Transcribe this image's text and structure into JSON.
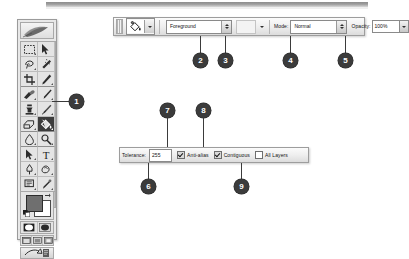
{
  "figure": {
    "application": "Adobe Photoshop",
    "context": "Paint Bucket tool options bar"
  },
  "toolbox": {
    "name": "Toolbox palette",
    "selected_tool": "paint-bucket-tool",
    "tools": [
      {
        "row": 0,
        "left": "rectangular-marquee-tool",
        "right": "move-tool"
      },
      {
        "row": 1,
        "left": "lasso-tool",
        "right": "magic-wand-tool"
      },
      {
        "row": 2,
        "left": "crop-tool",
        "right": "slice-tool"
      },
      {
        "row": 3,
        "left": "healing-brush-tool",
        "right": "brush-tool"
      },
      {
        "row": 4,
        "left": "clone-stamp-tool",
        "right": "history-brush-tool"
      },
      {
        "row": 5,
        "left": "eraser-tool",
        "right": "paint-bucket-tool"
      },
      {
        "row": 6,
        "left": "blur-tool",
        "right": "dodge-tool"
      },
      {
        "row": 7,
        "left": "path-selection-tool",
        "right": "type-tool"
      },
      {
        "row": 8,
        "left": "pen-tool",
        "right": "shape-tool"
      },
      {
        "row": 9,
        "left": "notes-tool",
        "right": "eyedropper-tool"
      },
      {
        "row": 10,
        "left": "hand-tool",
        "right": "zoom-tool"
      }
    ],
    "color_swatches": {
      "name": "foreground-background-color-swatches",
      "foreground": "#6f6f6f",
      "background": "#ffffff"
    },
    "quick_mask": [
      "standard-mode-button",
      "quick-mask-mode-button"
    ],
    "screen_modes": [
      "standard-screen-mode",
      "full-screen-with-menubar",
      "full-screen-mode"
    ],
    "jump_to": "jump-to-imageready-button"
  },
  "options_bar_top": {
    "tool_preset_icon": "paint-bucket-icon",
    "tool_preset_arrow": "chevron-down-icon",
    "fill_source": {
      "label": "Foreground",
      "options": [
        "Foreground",
        "Pattern"
      ]
    },
    "pattern_arrow": "chevron-down-icon",
    "mode_label": "Mode:",
    "mode_value": "Normal",
    "mode_options": [
      "Normal",
      "Dissolve",
      "Multiply",
      "Screen",
      "Overlay"
    ],
    "opacity_label": "Opacity:",
    "opacity_value": "100%"
  },
  "options_bar_bottom": {
    "tolerance_label": "Tolerance:",
    "tolerance_value": "255",
    "anti_alias_label": "Anti-alias",
    "anti_alias_checked": true,
    "contiguous_label": "Contiguous",
    "contiguous_checked": true,
    "all_layers_label": "All Layers",
    "all_layers_checked": false
  },
  "callouts": [
    {
      "id": "1",
      "number": "1",
      "target": "paint-bucket-tool-in-toolbox"
    },
    {
      "id": "2",
      "number": "2",
      "target": "fill-source-dropdown"
    },
    {
      "id": "3",
      "number": "3",
      "target": "pattern-picker-arrow"
    },
    {
      "id": "4",
      "number": "4",
      "target": "mode-dropdown"
    },
    {
      "id": "5",
      "number": "5",
      "target": "opacity-field"
    },
    {
      "id": "6",
      "number": "6",
      "target": "tolerance-field"
    },
    {
      "id": "7",
      "number": "7",
      "target": "anti-alias-checkbox"
    },
    {
      "id": "8",
      "number": "8",
      "target": "contiguous-checkbox"
    },
    {
      "id": "9",
      "number": "9",
      "target": "all-layers-checkbox"
    }
  ]
}
